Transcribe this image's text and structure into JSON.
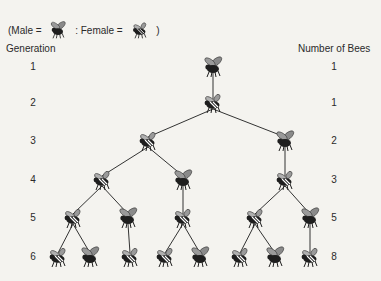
{
  "legend": {
    "open_paren": "(Male =",
    "separator": ": Female =",
    "close_paren": ")",
    "male_icon": "male-bee-icon",
    "female_icon": "female-bee-icon"
  },
  "headers": {
    "generation": "Generation",
    "number_of_bees": "Number of Bees"
  },
  "rows": [
    {
      "generation": "1",
      "count": "1",
      "y": 67
    },
    {
      "generation": "2",
      "count": "1",
      "y": 103
    },
    {
      "generation": "3",
      "count": "2",
      "y": 141
    },
    {
      "generation": "4",
      "count": "3",
      "y": 180
    },
    {
      "generation": "5",
      "count": "5",
      "y": 218
    },
    {
      "generation": "6",
      "count": "8",
      "y": 257
    }
  ],
  "colors": {
    "background": "#f4f3ef",
    "line": "#333333",
    "body": "#1e1e1e",
    "wing": "#8a8a8a",
    "female_band": "#ffffff"
  },
  "tree": {
    "nodes": [
      {
        "id": "g1",
        "sex": "male",
        "x": 213,
        "y": 67
      },
      {
        "id": "g2",
        "sex": "female",
        "x": 213,
        "y": 103
      },
      {
        "id": "g3a",
        "sex": "female",
        "x": 148,
        "y": 141
      },
      {
        "id": "g3b",
        "sex": "male",
        "x": 285,
        "y": 141
      },
      {
        "id": "g4a",
        "sex": "female",
        "x": 102,
        "y": 180
      },
      {
        "id": "g4b",
        "sex": "male",
        "x": 183,
        "y": 180
      },
      {
        "id": "g4c",
        "sex": "female",
        "x": 285,
        "y": 180
      },
      {
        "id": "g5a",
        "sex": "female",
        "x": 73,
        "y": 218
      },
      {
        "id": "g5b",
        "sex": "male",
        "x": 128,
        "y": 218
      },
      {
        "id": "g5c",
        "sex": "female",
        "x": 183,
        "y": 218
      },
      {
        "id": "g5d",
        "sex": "female",
        "x": 255,
        "y": 218
      },
      {
        "id": "g5e",
        "sex": "male",
        "x": 310,
        "y": 218
      },
      {
        "id": "g6a",
        "sex": "female",
        "x": 58,
        "y": 257
      },
      {
        "id": "g6b",
        "sex": "male",
        "x": 90,
        "y": 257
      },
      {
        "id": "g6c",
        "sex": "female",
        "x": 130,
        "y": 257
      },
      {
        "id": "g6d",
        "sex": "female",
        "x": 165,
        "y": 257
      },
      {
        "id": "g6e",
        "sex": "male",
        "x": 200,
        "y": 257
      },
      {
        "id": "g6f",
        "sex": "female",
        "x": 240,
        "y": 257
      },
      {
        "id": "g6g",
        "sex": "male",
        "x": 275,
        "y": 257
      },
      {
        "id": "g6h",
        "sex": "female",
        "x": 310,
        "y": 257
      }
    ],
    "edges": [
      [
        "g1",
        "g2"
      ],
      [
        "g2",
        "g3a"
      ],
      [
        "g2",
        "g3b"
      ],
      [
        "g3a",
        "g4a"
      ],
      [
        "g3a",
        "g4b"
      ],
      [
        "g3b",
        "g4c"
      ],
      [
        "g4a",
        "g5a"
      ],
      [
        "g4a",
        "g5b"
      ],
      [
        "g4b",
        "g5c"
      ],
      [
        "g4c",
        "g5d"
      ],
      [
        "g4c",
        "g5e"
      ],
      [
        "g5a",
        "g6a"
      ],
      [
        "g5a",
        "g6b"
      ],
      [
        "g5b",
        "g6c"
      ],
      [
        "g5c",
        "g6d"
      ],
      [
        "g5c",
        "g6e"
      ],
      [
        "g5d",
        "g6f"
      ],
      [
        "g5d",
        "g6g"
      ],
      [
        "g5e",
        "g6h"
      ]
    ]
  }
}
